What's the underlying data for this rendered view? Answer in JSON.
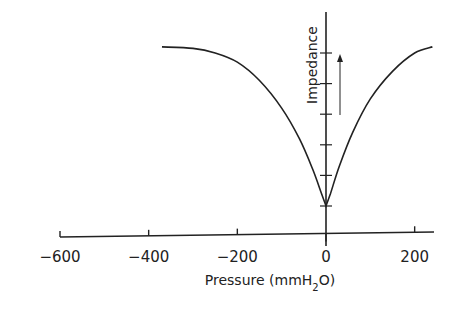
{
  "chart_data": {
    "type": "line",
    "title": "",
    "xlabel": "Pressure (mmH2O)",
    "xlabel_parts": {
      "main": "Pressure  (mmH",
      "sub": "2",
      "end": "O)"
    },
    "ylabel": "Impedance",
    "xlim": [
      -600,
      240
    ],
    "ylim": [
      0,
      7
    ],
    "x_ticks": [
      -600,
      -400,
      -200,
      0,
      200
    ],
    "x_tick_labels": [
      "-600",
      "-400",
      "-200",
      "0",
      "200"
    ],
    "y_ticks": [
      1,
      2,
      3,
      4,
      5,
      6
    ],
    "y_tick_labels": [],
    "grid": false,
    "legend": null,
    "annotations": [
      {
        "type": "arrow",
        "direction": "up",
        "x": 25,
        "y_from": 2.5,
        "y_to": 5.6,
        "meaning": "impedance increasing"
      }
    ],
    "series": [
      {
        "name": "Impedance curve",
        "x": [
          -370,
          -300,
          -250,
          -200,
          -150,
          -100,
          -60,
          -30,
          -10,
          0,
          10,
          30,
          60,
          100,
          150,
          200,
          240
        ],
        "y": [
          6.2,
          6.15,
          6.0,
          5.7,
          5.1,
          4.2,
          3.2,
          2.2,
          1.4,
          1.0,
          1.4,
          2.3,
          3.4,
          4.5,
          5.4,
          6.0,
          6.2
        ]
      }
    ]
  }
}
